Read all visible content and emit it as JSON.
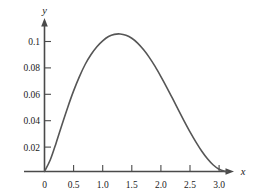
{
  "chart_data": {
    "type": "line",
    "title": "",
    "subtitle": "",
    "xlabel": "x",
    "ylabel": "y",
    "xlim": [
      0,
      3.3
    ],
    "ylim": [
      0,
      0.115
    ],
    "grid": false,
    "legend": null,
    "annotations": [],
    "x_ticks": [
      {
        "value": 0,
        "label": "0"
      },
      {
        "value": 0.5,
        "label": "0.5"
      },
      {
        "value": 1.0,
        "label": "1.0"
      },
      {
        "value": 1.5,
        "label": "1.5"
      },
      {
        "value": 2.0,
        "label": "2.0"
      },
      {
        "value": 2.5,
        "label": "2.5"
      },
      {
        "value": 3.0,
        "label": "3.0"
      }
    ],
    "y_ticks": [
      {
        "value": 0.02,
        "label": "0.02"
      },
      {
        "value": 0.04,
        "label": "0.04"
      },
      {
        "value": 0.06,
        "label": "0.06"
      },
      {
        "value": 0.08,
        "label": "0.08"
      },
      {
        "value": 0.1,
        "label": "0.1"
      }
    ],
    "series": [
      {
        "name": "curve",
        "color": "#565656",
        "x": [
          0.0,
          0.1,
          0.2,
          0.3,
          0.4,
          0.5,
          0.6,
          0.7,
          0.8,
          0.9,
          1.0,
          1.1,
          1.2,
          1.3,
          1.4,
          1.5,
          1.6,
          1.7,
          1.8,
          1.9,
          2.0,
          2.1,
          2.2,
          2.3,
          2.4,
          2.5,
          2.6,
          2.7,
          2.8,
          2.9,
          3.0,
          3.1,
          3.1416
        ],
        "y": [
          0.0,
          0.009,
          0.022,
          0.036,
          0.0495,
          0.062,
          0.073,
          0.0825,
          0.09,
          0.096,
          0.1005,
          0.1038,
          0.1055,
          0.1058,
          0.1048,
          0.1025,
          0.0988,
          0.0938,
          0.0878,
          0.0808,
          0.073,
          0.0648,
          0.0562,
          0.0474,
          0.0388,
          0.0305,
          0.0228,
          0.0158,
          0.0098,
          0.005,
          0.0017,
          0.0001,
          0.0
        ],
        "peak": {
          "x": 1.3,
          "y": 0.1058
        }
      }
    ]
  },
  "axes": {
    "x_axis_name": "x",
    "y_axis_name": "y",
    "origin_label": "0"
  },
  "colors": {
    "curve": "#565656",
    "axis": "#4a4a4a",
    "text": "#1a1a1a",
    "background": "#ffffff"
  }
}
